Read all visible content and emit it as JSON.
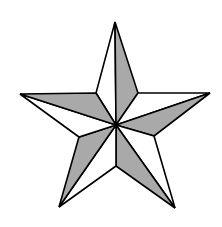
{
  "figure": {
    "colors": {
      "background": "#ffffff",
      "shade": "#a9a9a9",
      "light": "#ffffff",
      "stroke": "#000000"
    },
    "points": {
      "center": [
        116,
        125
      ],
      "tips": {
        "top": [
          115,
          22
        ],
        "right": [
          210,
          93
        ],
        "bottom_right": [
          175,
          208
        ],
        "bottom_left": [
          59,
          207
        ],
        "left": [
          20,
          94
        ]
      },
      "inner": {
        "top_right": [
          138,
          93
        ],
        "right": [
          154,
          136
        ],
        "bottom": [
          116,
          166
        ],
        "left": [
          79,
          137
        ],
        "top_left": [
          96,
          93
        ]
      }
    }
  }
}
